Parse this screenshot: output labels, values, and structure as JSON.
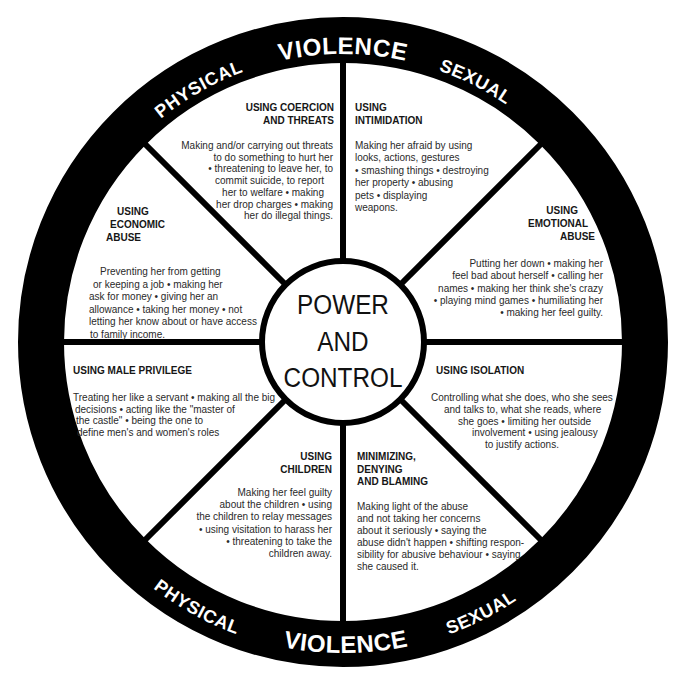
{
  "colors": {
    "ring": "#000000",
    "ring_text": "#ffffff",
    "spokes": "#000000",
    "background": "#ffffff",
    "body_text": "#2a2a2a"
  },
  "ring": {
    "top": {
      "left": "PHYSICAL",
      "center": "VIOLENCE",
      "right": "SEXUAL"
    },
    "bottom": {
      "left": "PHYSICAL",
      "center": "VIOLENCE",
      "right": "SEXUAL"
    }
  },
  "center": {
    "lines": [
      "POWER",
      "AND",
      "CONTROL"
    ]
  },
  "sections": {
    "coercion": {
      "heading": [
        "USING COERCION",
        "AND THREATS"
      ],
      "body": [
        "Making and/or carrying out threats",
        "to do something to hurt her",
        "• threatening to leave her, to",
        "commit suicide, to report",
        "her to welfare • making",
        "her drop charges • making",
        "her do illegal things."
      ]
    },
    "intimidation": {
      "heading": [
        "USING",
        "INTIMIDATION"
      ],
      "body": [
        "Making her afraid by using",
        "looks, actions, gestures",
        "• smashing things • destroying",
        "her property • abusing",
        "pets • displaying",
        "weapons."
      ]
    },
    "economic": {
      "heading": [
        "USING",
        "ECONOMIC",
        "ABUSE"
      ],
      "body": [
        "Preventing her from getting",
        "or keeping a job • making her",
        "ask for money • giving her an",
        "allowance • taking her money • not",
        "letting her know about or have access",
        "to family income."
      ]
    },
    "emotional": {
      "heading": [
        "USING",
        "EMOTIONAL",
        "ABUSE"
      ],
      "body": [
        "Putting her down • making her",
        "feel bad about herself • calling her",
        "names • making her think she's crazy",
        "• playing mind games • humiliating her",
        "• making her feel guilty."
      ]
    },
    "male_privilege": {
      "heading": [
        "USING MALE PRIVILEGE"
      ],
      "body": [
        "Treating her like a servant • making all the big",
        "decisions • acting like the \"master of",
        "the castle\" • being the one to",
        "define men's and women's roles"
      ]
    },
    "isolation": {
      "heading": [
        "USING ISOLATION"
      ],
      "body": [
        "Controlling what she does, who she sees",
        "and talks to, what she reads, where",
        "she goes • limiting her outside",
        "involvement • using jealousy",
        "to justify actions."
      ]
    },
    "children": {
      "heading": [
        "USING",
        "CHILDREN"
      ],
      "body": [
        "Making her feel guilty",
        "about the children • using",
        "the children to relay messages",
        "• using visitation to harass her",
        "• threatening to take the",
        "children away."
      ]
    },
    "minimizing": {
      "heading": [
        "MINIMIZING,",
        "DENYING",
        "AND BLAMING"
      ],
      "body": [
        "Making light of the abuse",
        "and not taking her concerns",
        "about it seriously • saying the",
        "abuse didn't happen • shifting respon-",
        "sibility for abusive behaviour • saying",
        "she caused it."
      ]
    }
  }
}
